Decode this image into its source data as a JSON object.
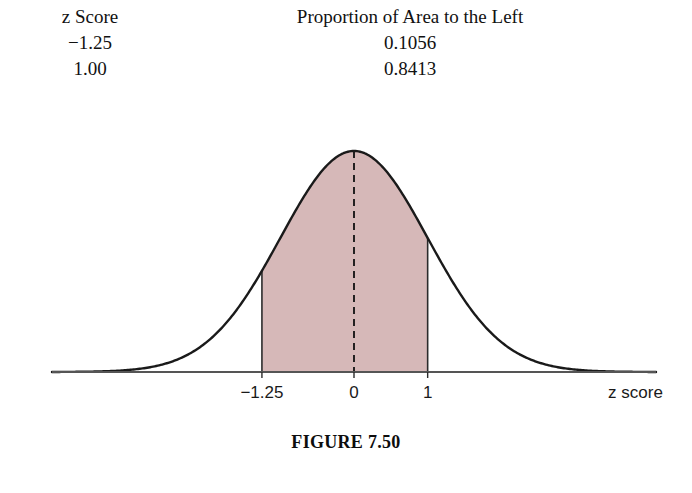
{
  "table": {
    "headers": [
      "z Score",
      "Proportion of Area to the Left"
    ],
    "rows": [
      {
        "z": "−1.25",
        "proportion": "0.1056"
      },
      {
        "z": "1.00",
        "proportion": "0.8413"
      }
    ]
  },
  "figure": {
    "caption": "FIGURE 7.50",
    "axis_title": "z score",
    "tick_labels": [
      "−1.25",
      "0",
      "1"
    ],
    "curve_color": "#1a1a1a",
    "shade_color": "#d6b8b8",
    "axis_color": "#555555",
    "dashed_line_color": "#111111"
  },
  "chart_data": {
    "type": "area",
    "title": "FIGURE 7.50",
    "xlabel": "z score",
    "ylabel": "",
    "distribution": "standard normal",
    "mean": 0,
    "sd": 1,
    "xlim": [
      -4.1,
      4.1
    ],
    "ylim": [
      0,
      0.4
    ],
    "xticks": [
      -1.25,
      0,
      1
    ],
    "xtick_labels": [
      "−1.25",
      "0",
      "1"
    ],
    "grid": false,
    "legend": null,
    "shaded_region": {
      "from": -1.25,
      "to": 1,
      "area": 0.7357,
      "color": "#d6b8b8"
    },
    "reference_lines": [
      {
        "x": 0,
        "style": "dashed",
        "from_y": 0,
        "to_y": 0.3989
      }
    ],
    "annotations": [
      {
        "z": -1.25,
        "proportion_to_left": 0.1056
      },
      {
        "z": 1.0,
        "proportion_to_left": 0.8413
      }
    ],
    "x": [
      -4.0,
      -3.75,
      -3.5,
      -3.25,
      -3.0,
      -2.75,
      -2.5,
      -2.25,
      -2.0,
      -1.75,
      -1.5,
      -1.25,
      -1.0,
      -0.75,
      -0.5,
      -0.25,
      0.0,
      0.25,
      0.5,
      0.75,
      1.0,
      1.25,
      1.5,
      1.75,
      2.0,
      2.25,
      2.5,
      2.75,
      3.0,
      3.25,
      3.5,
      3.75,
      4.0
    ],
    "y": [
      0.0001,
      0.0004,
      0.0009,
      0.002,
      0.0044,
      0.0091,
      0.0175,
      0.0317,
      0.054,
      0.0863,
      0.1295,
      0.1826,
      0.242,
      0.3011,
      0.3521,
      0.3867,
      0.3989,
      0.3867,
      0.3521,
      0.3011,
      0.242,
      0.1826,
      0.1295,
      0.0863,
      0.054,
      0.0317,
      0.0175,
      0.0091,
      0.0044,
      0.002,
      0.0009,
      0.0004,
      0.0001
    ]
  }
}
